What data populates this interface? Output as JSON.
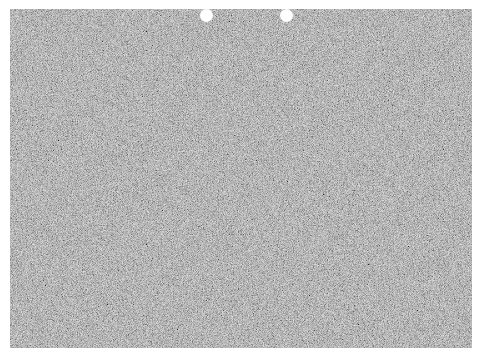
{
  "image": {
    "description": "Gray speckled textured sheet with two punched holes along the top edge",
    "background_color": "#ffffff",
    "sheet": {
      "x": 10,
      "y": 9,
      "width": 462,
      "height": 339,
      "color": "#8f8f8f"
    },
    "holes": [
      {
        "cx": 207,
        "cy": 16,
        "r": 6.5,
        "color": "#ffffff"
      },
      {
        "cx": 287,
        "cy": 16,
        "r": 6.5,
        "color": "#ffffff"
      }
    ]
  }
}
